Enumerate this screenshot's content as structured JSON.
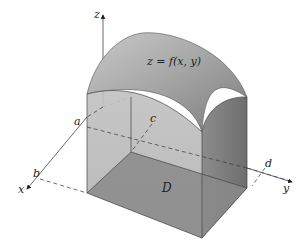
{
  "figure": {
    "labels": {
      "z_axis": "z",
      "x_axis": "x",
      "y_axis": "y",
      "surface": "z = f(x, y)",
      "a": "a",
      "b": "b",
      "c": "c",
      "d": "d",
      "region": "D"
    },
    "colors": {
      "background": "#ffffff",
      "surface_top": "#9a9a9a",
      "surface_highlight": "#c8c8c8",
      "left_face": "#b4b4b4",
      "front_face": "#8f8f8f",
      "right_face": "#7a7a7a",
      "base_region": "#858585",
      "lines": "#333333"
    }
  }
}
